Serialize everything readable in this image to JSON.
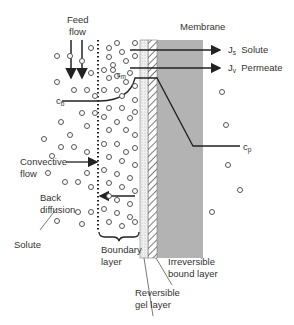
{
  "diagram": {
    "title_membrane": "Membrane",
    "feed_flow": [
      "Feed",
      "flow"
    ],
    "flux_solute": {
      "symbol": "J",
      "sub": "s",
      "label": "Solute"
    },
    "flux_permeate": {
      "symbol": "J",
      "sub": "v",
      "label": "Permeate"
    },
    "cb": {
      "symbol": "c",
      "sub": "b"
    },
    "cm": {
      "symbol": "c",
      "sub": "m"
    },
    "cp": {
      "symbol": "c",
      "sub": "p"
    },
    "convective_flow": [
      "Convective",
      "flow"
    ],
    "back_diffusion": [
      "Back",
      "diffusion"
    ],
    "solute": "Solute",
    "boundary_layer": [
      "Boundary",
      "layer"
    ],
    "reversible_gel": [
      "Reversible",
      "gel layer"
    ],
    "irreversible_bound": [
      "Irreversible",
      "bound layer"
    ],
    "colors": {
      "membrane": "#b0b0b0",
      "line": "#222222",
      "circle": "#555555"
    }
  }
}
